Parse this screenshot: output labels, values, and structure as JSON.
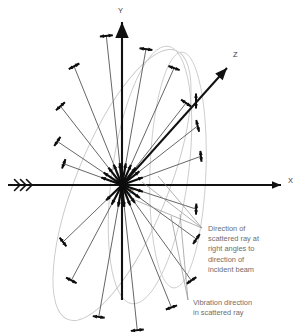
{
  "figure": {
    "background_color": "#ffffff",
    "width": 300,
    "height": 336,
    "origin": {
      "x": 122,
      "y": 185,
      "label": "P"
    }
  },
  "axes": [
    {
      "name": "x-axis",
      "label": "X",
      "label_x": 288,
      "label_y": 183,
      "x1": 8,
      "y1": 185,
      "x2": 281,
      "y2": 185,
      "color": "#111111",
      "has_incident_chevrons": true
    },
    {
      "name": "y-axis",
      "label": "Y",
      "label_x": 118,
      "label_y": 13,
      "x1": 122,
      "y1": 22,
      "x2": 122,
      "y2": 300,
      "color": "#111111",
      "has_incident_chevrons": false
    },
    {
      "name": "z-axis",
      "label": "Z",
      "label_x": 233,
      "label_y": 57,
      "x1": 122,
      "y1": 185,
      "x2": 227,
      "y2": 68,
      "color": "#111111",
      "has_incident_chevrons": false
    }
  ],
  "incident_beam": {
    "name": "incident-beam-chevrons",
    "chevron_count": 3,
    "x_positions": [
      20,
      26,
      32
    ],
    "y": 185,
    "size": 5.5,
    "color": "#111111"
  },
  "ellipses": [
    {
      "name": "scattering-ellipse-major",
      "cx": 122,
      "cy": 185,
      "rx": 46,
      "ry": 145,
      "rotation": 22,
      "color": "#c9c9c9"
    },
    {
      "name": "scattering-ellipse-secondary",
      "cx": 150,
      "cy": 175,
      "rx": 38,
      "ry": 130,
      "rotation": 8,
      "color": "#c9c9c9"
    },
    {
      "name": "scattering-ellipse-right",
      "cx": 178,
      "cy": 170,
      "rx": 28,
      "ry": 118,
      "rotation": 2,
      "color": "#c9c9c9"
    }
  ],
  "scattered_rays": [
    {
      "name": "ray-1",
      "angle_deg": 96,
      "length": 150,
      "vib_angle_deg": 6,
      "vib_len": 13
    },
    {
      "name": "ray-2",
      "angle_deg": 80,
      "length": 138,
      "vib_angle_deg": 172,
      "vib_len": 13
    },
    {
      "name": "ray-3",
      "angle_deg": 66,
      "length": 128,
      "vib_angle_deg": 160,
      "vib_len": 12
    },
    {
      "name": "ray-4",
      "angle_deg": 112,
      "length": 128,
      "vib_angle_deg": 28,
      "vib_len": 12
    },
    {
      "name": "ray-5",
      "angle_deg": 128,
      "length": 100,
      "vib_angle_deg": 42,
      "vib_len": 12
    },
    {
      "name": "ray-6",
      "angle_deg": 52,
      "length": 104,
      "vib_angle_deg": 146,
      "vib_len": 12
    },
    {
      "name": "ray-7",
      "angle_deg": 38,
      "length": 96,
      "vib_angle_deg": 104,
      "vib_len": 12
    },
    {
      "name": "ray-8",
      "angle_deg": 20,
      "length": 84,
      "vib_angle_deg": 96,
      "vib_len": 11
    },
    {
      "name": "ray-9",
      "angle_deg": 146,
      "length": 78,
      "vib_angle_deg": 56,
      "vib_len": 11
    },
    {
      "name": "ray-10",
      "angle_deg": -84,
      "length": 146,
      "vib_angle_deg": 6,
      "vib_len": 13
    },
    {
      "name": "ray-11",
      "angle_deg": -68,
      "length": 132,
      "vib_angle_deg": 20,
      "vib_len": 12
    },
    {
      "name": "ray-12",
      "angle_deg": -54,
      "length": 118,
      "vib_angle_deg": 34,
      "vib_len": 12
    },
    {
      "name": "ray-13",
      "angle_deg": -100,
      "length": 134,
      "vib_angle_deg": 172,
      "vib_len": 12
    },
    {
      "name": "ray-14",
      "angle_deg": -118,
      "length": 108,
      "vib_angle_deg": 152,
      "vib_len": 12
    },
    {
      "name": "ray-15",
      "angle_deg": -136,
      "length": 82,
      "vib_angle_deg": 128,
      "vib_len": 11
    },
    {
      "name": "ray-16",
      "angle_deg": -36,
      "length": 92,
      "vib_angle_deg": 56,
      "vib_len": 12
    },
    {
      "name": "ray-17",
      "angle_deg": -18,
      "length": 78,
      "vib_angle_deg": 88,
      "vib_len": 11
    },
    {
      "name": "ray-18",
      "angle_deg": 160,
      "length": 62,
      "vib_angle_deg": 70,
      "vib_len": 10
    }
  ],
  "z_vibration_marker": {
    "name": "z-axis-vibration-arrow",
    "x": 196,
    "y": 101,
    "angle_deg": 90,
    "length": 15
  },
  "annotations": [
    {
      "name": "annotation-scattered-ray-direction",
      "text_lines": [
        "Direction of",
        "scattered ray at",
        "right angles to",
        "direction of",
        "incident beam"
      ],
      "text_x": 208,
      "text_y": 231,
      "line_height": 10.2,
      "leader_target_x": 202,
      "leader_target_y": 228,
      "leader_sources": [
        {
          "x": 142,
          "y": 182
        },
        {
          "x": 158,
          "y": 176
        },
        {
          "x": 135,
          "y": 200
        }
      ]
    },
    {
      "name": "annotation-vibration-direction",
      "text_lines": [
        "Vibration direction",
        "in scattered ray"
      ],
      "text_x": 193,
      "text_y": 305,
      "line_height": 10.2,
      "leader_target_x": 188,
      "leader_target_y": 300,
      "leader_sources": [
        {
          "x": 171,
          "y": 216
        },
        {
          "x": 180,
          "y": 214
        }
      ]
    }
  ],
  "chart_data": {
    "type": "scatter",
    "xlabel": "X",
    "ylabel": "Y",
    "zlabel": "Z",
    "legend": [
      "Direction of scattered ray at right angles to direction of incident beam",
      "Vibration direction in scattered ray"
    ]
  }
}
